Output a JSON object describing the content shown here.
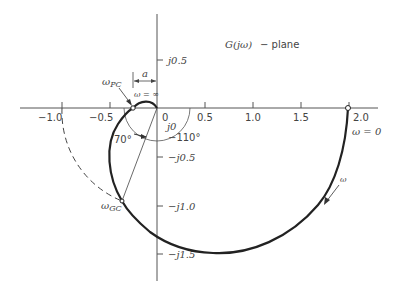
{
  "title": {
    "func": "G(jω)",
    "suffix": "− plane"
  },
  "axes": {
    "real_ticks": [
      {
        "value": -1.0,
        "label": "−1.0"
      },
      {
        "value": -0.5,
        "label": "−0.5"
      },
      {
        "value": 0,
        "label": "0"
      },
      {
        "value": 0.5,
        "label": "0.5"
      },
      {
        "value": 1.0,
        "label": "1.0"
      },
      {
        "value": 1.5,
        "label": "1.5"
      },
      {
        "value": 2.0,
        "label": "2.0"
      }
    ],
    "imag_ticks": [
      {
        "value": 0.5,
        "label": "j0.5"
      },
      {
        "value": 0,
        "label": "j0"
      },
      {
        "value": -0.5,
        "label": "−j0.5"
      },
      {
        "value": -1.0,
        "label": "−j1.0"
      },
      {
        "value": -1.5,
        "label": "−j1.5"
      }
    ]
  },
  "annotations": {
    "omega_pc": "ωPC",
    "omega_pc_main": "ω",
    "omega_pc_sub": "PC",
    "omega_gc_main": "ω",
    "omega_gc_sub": "GC",
    "a_label": "a",
    "omega_inf": "ω = ∞",
    "omega_zero": "ω = 0",
    "omega_dir": "ω",
    "angle_70": "70°",
    "angle_110": "−110°"
  },
  "colors": {
    "curve": "#222222",
    "axis": "#555555",
    "text": "#444444"
  }
}
